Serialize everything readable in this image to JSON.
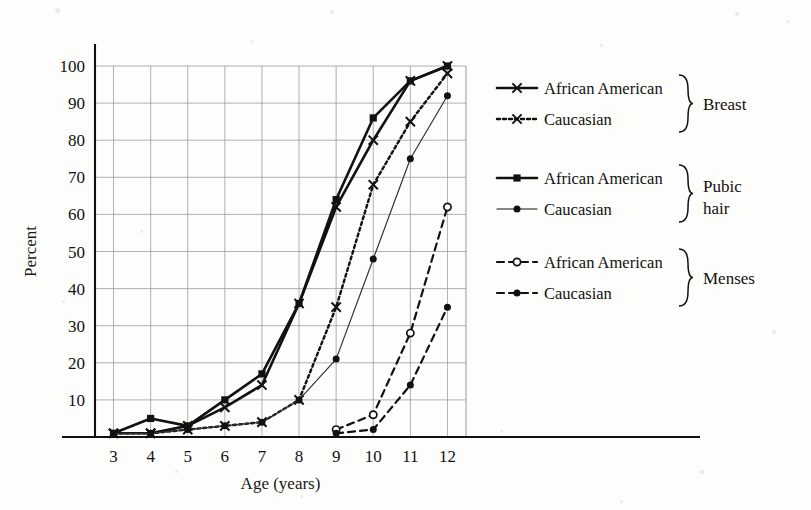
{
  "figure": {
    "background_color": "#fdfdfc",
    "ink_color": "#111111",
    "grid_color": "#9a9a9a"
  },
  "axes": {
    "xlabel": "Age (years)",
    "ylabel": "Percent",
    "x_ticks": [
      "3",
      "4",
      "5",
      "6",
      "7",
      "8",
      "9",
      "10",
      "11",
      "12"
    ],
    "y_ticks": [
      "10",
      "20",
      "30",
      "40",
      "50",
      "60",
      "70",
      "80",
      "90",
      "100"
    ]
  },
  "legend": {
    "groups": [
      {
        "name": "Breast",
        "label": "Breast",
        "entries": [
          {
            "label": "African American",
            "style": "solid",
            "marker": "x",
            "filled": true
          },
          {
            "label": "Caucasian",
            "style": "dotted",
            "marker": "x",
            "filled": true
          }
        ]
      },
      {
        "name": "Pubic hair",
        "label": "Pubic\nhair",
        "label_line1": "Pubic",
        "label_line2": "hair",
        "entries": [
          {
            "label": "African American",
            "style": "solid",
            "marker": "square",
            "filled": true
          },
          {
            "label": "Caucasian",
            "style": "solid-thin",
            "marker": "circle",
            "filled": true
          }
        ]
      },
      {
        "name": "Menses",
        "label": "Menses",
        "entries": [
          {
            "label": "African American",
            "style": "dashed",
            "marker": "circle-open",
            "filled": false
          },
          {
            "label": "Caucasian",
            "style": "dashed",
            "marker": "circle",
            "filled": true
          }
        ]
      }
    ]
  },
  "chart_data": {
    "type": "line",
    "title": "",
    "xlabel": "Age (years)",
    "ylabel": "Percent",
    "x": [
      3,
      4,
      5,
      6,
      7,
      8,
      9,
      10,
      11,
      12
    ],
    "xlim": [
      2.5,
      12.5
    ],
    "ylim": [
      0,
      105
    ],
    "grid": true,
    "legend_position": "right",
    "series": [
      {
        "name": "Breast - African American",
        "group": "Breast",
        "race": "African American",
        "style": "solid",
        "marker": "x",
        "color": "#111111",
        "values": [
          1,
          1,
          3,
          8,
          14,
          36,
          62,
          80,
          96,
          100
        ]
      },
      {
        "name": "Breast - Caucasian",
        "group": "Breast",
        "race": "Caucasian",
        "style": "dotted",
        "marker": "x",
        "color": "#111111",
        "values": [
          1,
          1,
          2,
          3,
          4,
          10,
          35,
          68,
          85,
          98
        ]
      },
      {
        "name": "Pubic hair - African American",
        "group": "Pubic hair",
        "race": "African American",
        "style": "solid",
        "marker": "square",
        "color": "#111111",
        "values": [
          1,
          5,
          3,
          10,
          17,
          36,
          64,
          86,
          96,
          100
        ]
      },
      {
        "name": "Pubic hair - Caucasian",
        "group": "Pubic hair",
        "race": "Caucasian",
        "style": "solid-thin",
        "marker": "circle",
        "color": "#333333",
        "values": [
          1,
          1,
          2,
          3,
          4,
          10,
          21,
          48,
          75,
          92
        ]
      },
      {
        "name": "Menses - African American",
        "group": "Menses",
        "race": "African American",
        "style": "dashed",
        "marker": "circle-open",
        "color": "#111111",
        "values": [
          null,
          null,
          null,
          null,
          null,
          null,
          2,
          6,
          28,
          62
        ]
      },
      {
        "name": "Menses - Caucasian",
        "group": "Menses",
        "race": "Caucasian",
        "style": "dashed",
        "marker": "circle",
        "color": "#111111",
        "values": [
          null,
          null,
          null,
          null,
          null,
          null,
          1,
          2,
          14,
          35
        ]
      }
    ]
  }
}
